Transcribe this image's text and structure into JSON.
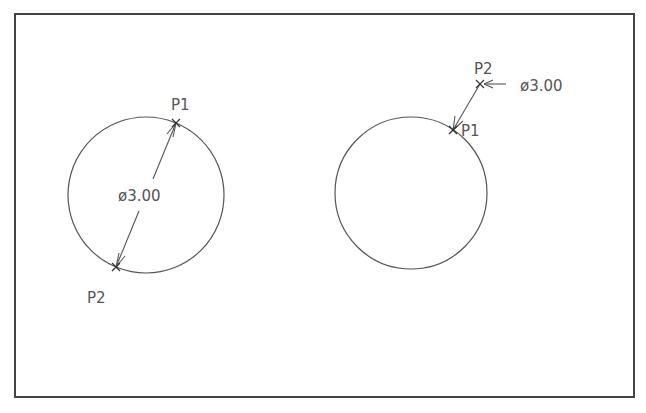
{
  "diagram": {
    "frame": {
      "x": 15,
      "y": 14,
      "width": 619,
      "height": 383,
      "stroke": "#444444"
    },
    "colors": {
      "line": "#555555",
      "text": "#555555"
    },
    "left": {
      "circle": {
        "cx": 146,
        "cy": 195,
        "r": 78
      },
      "p1": {
        "label": "P1",
        "x": 176,
        "y": 123
      },
      "p2": {
        "label": "P2",
        "x": 116,
        "y": 267
      },
      "dimension": "ø3.00"
    },
    "right": {
      "circle": {
        "cx": 411,
        "cy": 193,
        "r": 76
      },
      "p1": {
        "label": "P1",
        "x": 453,
        "y": 130
      },
      "p2": {
        "label": "P2",
        "x": 480,
        "y": 84
      },
      "dimension": "ø3.00"
    }
  }
}
